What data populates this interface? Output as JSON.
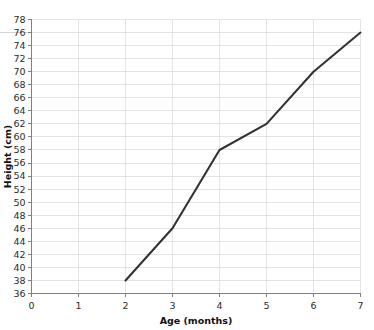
{
  "chart_data": {
    "type": "line",
    "title": "",
    "xlabel": "Age (months)",
    "ylabel": "Height (cm)",
    "xlim": [
      0,
      7
    ],
    "ylim": [
      36,
      78
    ],
    "xticks": [
      0,
      1,
      2,
      3,
      4,
      5,
      6,
      7
    ],
    "yticks": [
      36,
      38,
      40,
      42,
      44,
      46,
      48,
      50,
      52,
      54,
      56,
      58,
      60,
      62,
      64,
      66,
      68,
      70,
      72,
      74,
      76,
      78
    ],
    "grid": true,
    "legend": "none",
    "series": [
      {
        "name": "Height",
        "x": [
          2,
          3,
          4,
          5,
          6,
          7
        ],
        "values": [
          38,
          46,
          58,
          62,
          70,
          76
        ],
        "color": "#333333"
      }
    ]
  },
  "axes": {
    "x_title": "Age (months)",
    "y_title": "Height (cm)",
    "x_tick_labels": [
      "0",
      "1",
      "2",
      "3",
      "4",
      "5",
      "6",
      "7"
    ],
    "y_tick_labels": [
      "78",
      "76",
      "74",
      "72",
      "70",
      "68",
      "66",
      "64",
      "62",
      "60",
      "58",
      "56",
      "54",
      "52",
      "50",
      "48",
      "46",
      "44",
      "42",
      "40",
      "38",
      "36"
    ]
  },
  "colors": {
    "line": "#333333",
    "grid": "#d9d9d9",
    "axis": "#808080",
    "text": "#2b2b2b",
    "background": "#ffffff"
  }
}
